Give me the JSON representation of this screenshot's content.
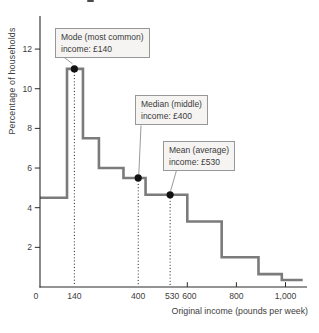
{
  "figure": {
    "y_axis_title": "Percentage of households",
    "x_axis_title": "Original income (pounds per week)"
  },
  "chart_data": {
    "type": "line",
    "subtype": "step-histogram",
    "title": "",
    "xlabel": "Original income (pounds per week)",
    "ylabel": "Percentage of households",
    "xlim": [
      0,
      1090
    ],
    "ylim": [
      0,
      13.6
    ],
    "grid": false,
    "legend": "none",
    "x_ticks": [
      {
        "value": 0,
        "label": "0",
        "tick_mark": false
      },
      {
        "value": 140,
        "label": "140",
        "tick_mark": false
      },
      {
        "value": 400,
        "label": "400",
        "tick_mark": false
      },
      {
        "value": 530,
        "label": "530",
        "tick_mark": false
      },
      {
        "value": 600,
        "label": "600",
        "tick_mark": true
      },
      {
        "value": 800,
        "label": "800",
        "tick_mark": true
      },
      {
        "value": 1000,
        "label": "1,000",
        "tick_mark": true
      }
    ],
    "y_ticks": [
      {
        "value": 2,
        "label": "2"
      },
      {
        "value": 4,
        "label": "4"
      },
      {
        "value": 6,
        "label": "6"
      },
      {
        "value": 8,
        "label": "8"
      },
      {
        "value": 10,
        "label": "10"
      },
      {
        "value": 12,
        "label": "12"
      }
    ],
    "steps": [
      {
        "from": 0,
        "to": 110,
        "percent": 4.5
      },
      {
        "from": 110,
        "to": 175,
        "percent": 11
      },
      {
        "from": 175,
        "to": 240,
        "percent": 7.5
      },
      {
        "from": 240,
        "to": 340,
        "percent": 6.0
      },
      {
        "from": 340,
        "to": 430,
        "percent": 5.5
      },
      {
        "from": 430,
        "to": 600,
        "percent": 4.65
      },
      {
        "from": 600,
        "to": 740,
        "percent": 3.3
      },
      {
        "from": 740,
        "to": 890,
        "percent": 1.5
      },
      {
        "from": 890,
        "to": 985,
        "percent": 0.65
      },
      {
        "from": 985,
        "to": 1070,
        "percent": 0.35
      }
    ],
    "markers": [
      {
        "id": "mode",
        "x": 140,
        "y": 11,
        "label_line1": "Mode (most common)",
        "label_line2": "income: £140"
      },
      {
        "id": "median",
        "x": 400,
        "y": 5.5,
        "label_line1": "Median (middle)",
        "label_line2": "income: £400"
      },
      {
        "id": "mean",
        "x": 530,
        "y": 4.65,
        "label_line1": "Mean (average)",
        "label_line2": "income: £530"
      }
    ],
    "colors": {
      "line": "#7b7b7b",
      "axis": "#2b2b2b",
      "marker_dot": "#111111",
      "dotted_line": "#2e2e2e",
      "callout_bg": "#f5f4f2",
      "callout_border": "#979797",
      "text": "#3d3d3d"
    }
  }
}
